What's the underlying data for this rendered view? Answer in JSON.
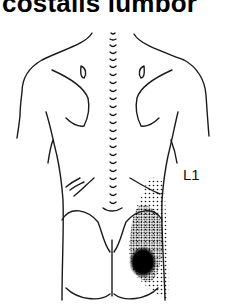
{
  "figure": {
    "title": "costalis lumbor",
    "label": "L1",
    "pain_pattern": "referred pain stippling over right lower back and buttock",
    "colors": {
      "line": "#1a1a1a",
      "dots": "#111111",
      "background": "#ffffff"
    }
  }
}
